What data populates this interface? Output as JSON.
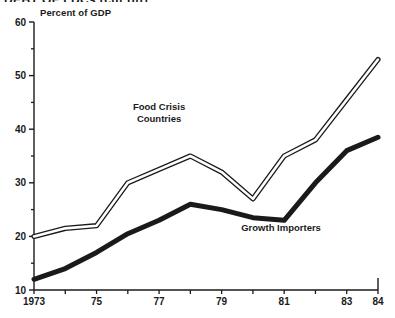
{
  "figure": {
    "title_clipped": "DEBT OF LDCs (cut off)",
    "ylabel": "Percent of GDP"
  },
  "chart_data": {
    "type": "line",
    "title": "Percent of GDP",
    "xlabel": "",
    "ylabel": "Percent of GDP",
    "xlim": [
      1973,
      1984
    ],
    "ylim": [
      10,
      60
    ],
    "grid": false,
    "legend_position": "inline-annotation",
    "x": [
      1973,
      1974,
      1975,
      1976,
      1977,
      1978,
      1979,
      1980,
      1981,
      1982,
      1983,
      1984
    ],
    "y_major_ticks": [
      10,
      20,
      30,
      40,
      50,
      60
    ],
    "y_minor_ticks": [
      15,
      25,
      35,
      45,
      55
    ],
    "x_tick_labels": [
      "1973",
      "",
      "75",
      "",
      "77",
      "",
      "79",
      "",
      "81",
      "",
      "83",
      "84"
    ],
    "series": [
      {
        "name": "Food Crisis Countries",
        "style": "outlined-double-line",
        "color": "#1a1a1a",
        "values": [
          20,
          21.5,
          22,
          30,
          32.5,
          35,
          32,
          27,
          35,
          38,
          45.5,
          53
        ]
      },
      {
        "name": "Growth Importers",
        "style": "thick-solid-line",
        "color": "#1a1a1a",
        "values": [
          12,
          14,
          17,
          20.5,
          23,
          26,
          25,
          23.5,
          23,
          30,
          36,
          38.5
        ]
      }
    ],
    "annotations": [
      {
        "text": "Food Crisis",
        "x": 1977.0,
        "y": 43.5
      },
      {
        "text": "Countries",
        "x": 1977.0,
        "y": 41.3
      },
      {
        "text": "Growth Importers",
        "x": 1980.9,
        "y": 21.0
      }
    ]
  }
}
